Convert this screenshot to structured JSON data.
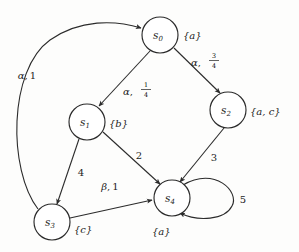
{
  "diagram": {
    "type": "labeled-markov-transition-system",
    "background_color": "#fdfdfc",
    "stroke_color": "#2b2b2b",
    "nodes": [
      {
        "id": "s0",
        "name": "s",
        "sub": "0",
        "cx": 160,
        "cy": 35,
        "r": 18,
        "atomic_props": "{a}",
        "ap_x": 183,
        "ap_y": 36
      },
      {
        "id": "s1",
        "name": "s",
        "sub": "1",
        "cx": 87,
        "cy": 122,
        "r": 18,
        "atomic_props": "{b}",
        "ap_x": 109,
        "ap_y": 124
      },
      {
        "id": "s2",
        "name": "s",
        "sub": "2",
        "cx": 228,
        "cy": 110,
        "r": 18,
        "atomic_props": "{a, c}",
        "ap_x": 250,
        "ap_y": 112
      },
      {
        "id": "s3",
        "name": "s",
        "sub": "3",
        "cx": 52,
        "cy": 222,
        "r": 18,
        "atomic_props": "{c}",
        "ap_x": 75,
        "ap_y": 229
      },
      {
        "id": "s4",
        "name": "s",
        "sub": "4",
        "cx": 172,
        "cy": 198,
        "r": 18,
        "atomic_props": "{a}",
        "ap_x": 161,
        "ap_y": 228
      }
    ],
    "edges": [
      {
        "id": "s0-s2",
        "from": "s0",
        "to": "s2",
        "label_kind": "fraction",
        "label_greek": "α",
        "label_sep": ",",
        "numerator": "3",
        "denominator": "4",
        "label_x": 202,
        "label_y": 63
      },
      {
        "id": "s0-s1",
        "from": "s0",
        "to": "s1",
        "label_kind": "fraction",
        "label_greek": "α",
        "label_sep": ",",
        "numerator": "1",
        "denominator": "4",
        "label_x": 135,
        "label_y": 91
      },
      {
        "id": "s3-s0",
        "from": "s3",
        "to": "s0",
        "label_kind": "greek-number",
        "label_greek": "α",
        "label_sep": ",",
        "label_value": "1",
        "label_x": 27,
        "label_y": 75
      },
      {
        "id": "s1-s3",
        "from": "s1",
        "to": "s3",
        "label_kind": "number",
        "label_value": "4",
        "label_x": 81,
        "label_y": 172
      },
      {
        "id": "s1-s4",
        "from": "s1",
        "to": "s4",
        "label_kind": "number",
        "label_value": "2",
        "label_x": 139,
        "label_y": 155
      },
      {
        "id": "s2-s4",
        "from": "s2",
        "to": "s4",
        "label_kind": "number",
        "label_value": "3",
        "label_x": 214,
        "label_y": 157
      },
      {
        "id": "s3-s4",
        "from": "s3",
        "to": "s4",
        "label_kind": "greek-number",
        "label_greek": "β",
        "label_sep": ",",
        "label_value": "1",
        "label_x": 110,
        "label_y": 186
      },
      {
        "id": "s4-s4",
        "from": "s4",
        "to": "s4",
        "label_kind": "number",
        "label_value": "5",
        "label_x": 242,
        "label_y": 199
      }
    ]
  }
}
